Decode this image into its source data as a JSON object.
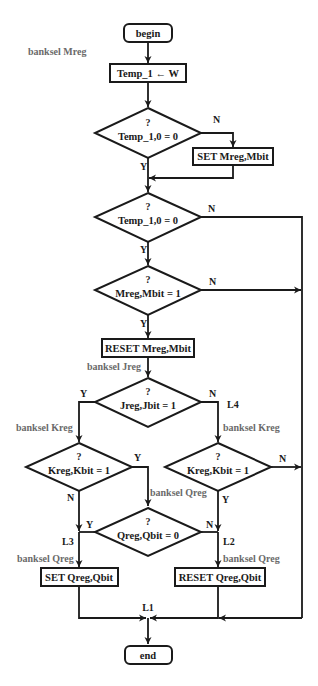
{
  "diagram": {
    "type": "flowchart",
    "start": {
      "label": "begin"
    },
    "end": {
      "label": "end"
    },
    "annotations": {
      "banksel_mreg": "banksel Mreg",
      "banksel_jreg": "banksel Jreg",
      "banksel_kreg_left": "banksel Kreg",
      "banksel_kreg_right": "banksel Kreg",
      "banksel_qreg_mid": "banksel Qreg",
      "banksel_qreg_left": "banksel Qreg",
      "banksel_qreg_right": "banksel Qreg"
    },
    "processes": {
      "temp_assign": "Temp_1 ← W",
      "set_mreg": "SET Mreg,Mbit",
      "reset_mreg": "RESET Mreg,Mbit",
      "set_qreg": "SET Qreg,Qbit",
      "reset_qreg": "RESET Qreg,Qbit"
    },
    "decisions": {
      "d1": {
        "q": "?",
        "cond": "Temp_1,0 = 0"
      },
      "d2": {
        "q": "?",
        "cond": "Temp_1,0 = 0"
      },
      "d3": {
        "q": "?",
        "cond": "Mreg,Mbit = 1"
      },
      "d4": {
        "q": "?",
        "cond": "Jreg,Jbit  = 1"
      },
      "d5": {
        "q": "?",
        "cond": "Kreg,Kbit  = 1"
      },
      "d6": {
        "q": "?",
        "cond": "Kreg,Kbit  = 1"
      },
      "d7": {
        "q": "?",
        "cond": "Qreg,Qbit  = 0"
      }
    },
    "branch_labels": {
      "d1_no": "N",
      "d1_yes": "Y",
      "d2_no": "N",
      "d2_yes": "Y",
      "d3_no": "N",
      "d3_yes": "Y",
      "d4_yes": "Y",
      "d4_no": "N",
      "d5_yes": "Y",
      "d5_no": "N",
      "d6_no": "N",
      "d6_yes": "Y",
      "d7_yes": "Y",
      "d7_no": "N"
    },
    "jump_labels": {
      "l1": "L1",
      "l2": "L2",
      "l3": "L3",
      "l4": "L4"
    }
  }
}
